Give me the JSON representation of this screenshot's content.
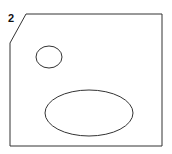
{
  "figure": {
    "label": "2",
    "stroke_color": "#333333",
    "shapes": [
      {
        "type": "polygon",
        "name": "outline",
        "points": "26,14 162,14 162,146 10,146 10,43"
      },
      {
        "type": "ellipse",
        "name": "small-ellipse",
        "cx": 49,
        "cy": 57,
        "rx": 13,
        "ry": 11
      },
      {
        "type": "ellipse",
        "name": "large-ellipse",
        "cx": 89,
        "cy": 113,
        "rx": 44,
        "ry": 23
      }
    ]
  }
}
